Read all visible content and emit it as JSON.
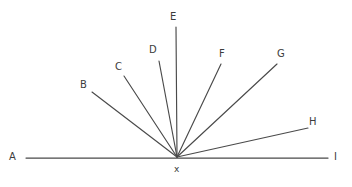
{
  "figure": {
    "background_color": "#ffffff",
    "line_color": "#4a4a4a",
    "label_color": "#3c3c3c",
    "width": 352,
    "height": 187
  },
  "chart_data": {
    "type": "diagram",
    "title": "",
    "vertex": {
      "name": "x",
      "label": "x",
      "x": 177,
      "y": 157,
      "label_x": 174,
      "label_y": 165
    },
    "baseline": {
      "name": "line-AI",
      "from_label": "A",
      "to_label": "I",
      "x1": 26,
      "y1": 158,
      "x2": 328,
      "y2": 158
    },
    "points": [
      {
        "label": "A",
        "end_x": 26,
        "end_y": 158,
        "label_x": 9,
        "label_y": 152,
        "is_baseline_end": true
      },
      {
        "label": "B",
        "end_x": 92,
        "end_y": 92,
        "label_x": 80,
        "label_y": 80,
        "is_baseline_end": false
      },
      {
        "label": "C",
        "end_x": 124,
        "end_y": 76,
        "label_x": 115,
        "label_y": 62,
        "is_baseline_end": false
      },
      {
        "label": "D",
        "end_x": 159,
        "end_y": 61,
        "label_x": 149,
        "label_y": 45,
        "is_baseline_end": false
      },
      {
        "label": "E",
        "end_x": 176,
        "end_y": 27,
        "label_x": 170,
        "label_y": 12,
        "is_baseline_end": false
      },
      {
        "label": "F",
        "end_x": 221,
        "end_y": 64,
        "label_x": 219,
        "label_y": 49,
        "is_baseline_end": false
      },
      {
        "label": "G",
        "end_x": 277,
        "end_y": 64,
        "label_x": 277,
        "label_y": 49,
        "is_baseline_end": false
      },
      {
        "label": "H",
        "end_x": 308,
        "end_y": 128,
        "label_x": 309,
        "label_y": 117,
        "is_baseline_end": false
      },
      {
        "label": "I",
        "end_x": 328,
        "end_y": 158,
        "label_x": 334,
        "label_y": 152,
        "is_baseline_end": true
      }
    ],
    "rays": [
      {
        "name": "ray-xB",
        "to": "B"
      },
      {
        "name": "ray-xC",
        "to": "C"
      },
      {
        "name": "ray-xD",
        "to": "D"
      },
      {
        "name": "ray-xE",
        "to": "E"
      },
      {
        "name": "ray-xF",
        "to": "F"
      },
      {
        "name": "ray-xG",
        "to": "G"
      },
      {
        "name": "ray-xH",
        "to": "H"
      }
    ]
  }
}
